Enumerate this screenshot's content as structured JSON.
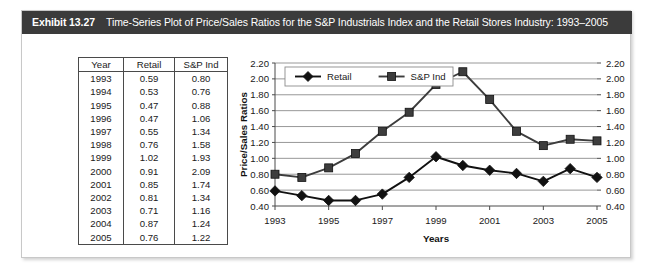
{
  "exhibit": {
    "label": "Exhibit 13.27",
    "caption": "Time-Series Plot of Price/Sales Ratios for the S&P Industrials Index and the Retail Stores Industry: 1993–2005",
    "header_bg": "#3b3b3b",
    "header_fg": "#ffffff"
  },
  "table": {
    "headers": [
      "Year",
      "Retail",
      "S&P Ind"
    ],
    "rows": [
      [
        "1993",
        "0.59",
        "0.80"
      ],
      [
        "1994",
        "0.53",
        "0.76"
      ],
      [
        "1995",
        "0.47",
        "0.88"
      ],
      [
        "1996",
        "0.47",
        "1.06"
      ],
      [
        "1997",
        "0.55",
        "1.34"
      ],
      [
        "1998",
        "0.76",
        "1.58"
      ],
      [
        "1999",
        "1.02",
        "1.93"
      ],
      [
        "2000",
        "0.91",
        "2.09"
      ],
      [
        "2001",
        "0.85",
        "1.74"
      ],
      [
        "2002",
        "0.81",
        "1.34"
      ],
      [
        "2003",
        "0.71",
        "1.16"
      ],
      [
        "2004",
        "0.87",
        "1.24"
      ],
      [
        "2005",
        "0.76",
        "1.22"
      ]
    ]
  },
  "chart_data": {
    "type": "line",
    "title": "",
    "xlabel": "Years",
    "ylabel": "Price/Sales Ratios",
    "x": [
      1993,
      1994,
      1995,
      1996,
      1997,
      1998,
      1999,
      2000,
      2001,
      2002,
      2003,
      2004,
      2005
    ],
    "xtick_labels": [
      "1993",
      "1995",
      "1997",
      "1999",
      "2001",
      "2003",
      "2005"
    ],
    "xtick_values": [
      1993,
      1995,
      1997,
      1999,
      2001,
      2003,
      2005
    ],
    "ytick_labels": [
      "0.40",
      "0.60",
      "0.80",
      "1.00",
      "1.20",
      "1.40",
      "1.60",
      "1.80",
      "2.00",
      "2.20"
    ],
    "ytick_values": [
      0.4,
      0.6,
      0.8,
      1.0,
      1.2,
      1.4,
      1.6,
      1.8,
      2.0,
      2.2
    ],
    "ylim": [
      0.4,
      2.2
    ],
    "xlim": [
      1993,
      2005
    ],
    "grid": "horizontal",
    "right_axis_mirrored": true,
    "legend_position": "top-left-inside",
    "series": [
      {
        "name": "Retail",
        "marker": "diamond",
        "color": "#111111",
        "values": [
          0.59,
          0.53,
          0.47,
          0.47,
          0.55,
          0.76,
          1.02,
          0.91,
          0.85,
          0.81,
          0.71,
          0.87,
          0.76
        ]
      },
      {
        "name": "S&P Ind",
        "marker": "square",
        "color": "#3d3d3d",
        "values": [
          0.8,
          0.76,
          0.88,
          1.06,
          1.34,
          1.58,
          1.93,
          2.09,
          1.74,
          1.34,
          1.16,
          1.24,
          1.22
        ]
      }
    ]
  }
}
